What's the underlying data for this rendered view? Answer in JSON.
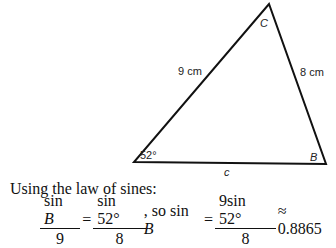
{
  "figure": {
    "vertices": {
      "A": {
        "x": 134,
        "y": 162
      },
      "B": {
        "x": 326,
        "y": 164
      },
      "C": {
        "x": 269,
        "y": 4
      }
    },
    "labels": {
      "angle_A": "52°",
      "vertex_B": "B",
      "vertex_C": "C",
      "side_AC": "9 cm",
      "side_BC": "8 cm",
      "side_AB": "c"
    }
  },
  "text": {
    "intro": "Using the law of sines:",
    "eq1_num": "sin",
    "eq1_num_var": "B",
    "eq1_den": "9",
    "eq_sign1": "=",
    "eq2_num": "sin 52°",
    "eq2_den": "8",
    "connector": ", so sin",
    "connector_var": "B",
    "eq_sign2": "=",
    "eq3_num": "9sin 52°",
    "eq3_den": "8",
    "approx": "≈ 0.8865"
  }
}
